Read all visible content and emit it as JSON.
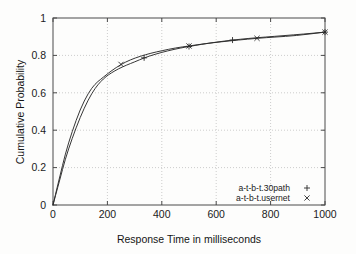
{
  "chart_data": {
    "type": "line",
    "title": "",
    "xlabel": "Response Time in milliseconds",
    "ylabel": "Cumulative Probability",
    "xlim": [
      0,
      1000
    ],
    "ylim": [
      0,
      1
    ],
    "xticks": [
      "0",
      "200",
      "400",
      "600",
      "800",
      "1000"
    ],
    "xtick_values": [
      0,
      200,
      400,
      600,
      800,
      1000
    ],
    "yticks": [
      "0",
      "0.2",
      "0.4",
      "0.6",
      "0.8",
      "1"
    ],
    "ytick_values": [
      0,
      0.2,
      0.4,
      0.6,
      0.8,
      1
    ],
    "grid": true,
    "legend_position": "lower right",
    "series": [
      {
        "name": "a-t-b-t.30path",
        "marker": "+",
        "x": [
          0,
          10,
          25,
          45,
          70,
          100,
          130,
          155,
          175,
          195,
          215,
          240,
          270,
          300,
          335,
          375,
          420,
          470,
          500,
          545,
          600,
          660,
          720,
          780,
          850,
          920,
          1000
        ],
        "y": [
          0.0,
          0.055,
          0.135,
          0.245,
          0.355,
          0.47,
          0.565,
          0.625,
          0.66,
          0.687,
          0.707,
          0.728,
          0.748,
          0.765,
          0.787,
          0.806,
          0.824,
          0.84,
          0.8475,
          0.859,
          0.871,
          0.882,
          0.891,
          0.898,
          0.906,
          0.914,
          0.9245
        ],
        "marker_points": [
          {
            "x": 335,
            "y": 0.787
          },
          {
            "x": 500,
            "y": 0.8475
          },
          {
            "x": 660,
            "y": 0.882
          },
          {
            "x": 1000,
            "y": 0.9245
          }
        ]
      },
      {
        "name": "a-t-b-t.usernet",
        "marker": "x",
        "x": [
          0,
          10,
          25,
          45,
          70,
          100,
          130,
          155,
          175,
          195,
          215,
          250,
          285,
          320,
          360,
          400,
          450,
          500,
          560,
          620,
          680,
          750,
          820,
          890,
          1000
        ],
        "y": [
          0.0,
          0.062,
          0.152,
          0.272,
          0.392,
          0.512,
          0.6,
          0.648,
          0.672,
          0.695,
          0.718,
          0.752,
          0.777,
          0.795,
          0.812,
          0.825,
          0.84,
          0.8505,
          0.863,
          0.873,
          0.882,
          0.8915,
          0.8985,
          0.905,
          0.9245
        ],
        "marker_points": [
          {
            "x": 250,
            "y": 0.752
          },
          {
            "x": 500,
            "y": 0.8505
          },
          {
            "x": 750,
            "y": 0.8915
          },
          {
            "x": 1000,
            "y": 0.9245
          }
        ]
      }
    ],
    "colors": {
      "line": "#2b2b2b",
      "grid": "#b9b9b9",
      "frame": "#4a4a4a",
      "background": "#fdfdfc",
      "text": "#1b1b1b"
    }
  }
}
